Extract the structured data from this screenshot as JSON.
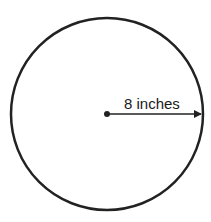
{
  "diagram": {
    "shape": "circle",
    "radius_label": "8 inches",
    "center": {
      "x": 107,
      "y": 114
    },
    "radius_px": 96,
    "stroke_color": "#222222"
  }
}
